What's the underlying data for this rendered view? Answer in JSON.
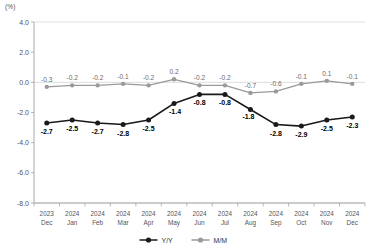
{
  "chart_data": {
    "type": "line",
    "title": "",
    "subtitle": "",
    "unit_label": "(%)",
    "xlabel": "",
    "ylabel": "",
    "ylim": [
      -8.0,
      4.0
    ],
    "yticks": [
      "4.0",
      "2.0",
      "0.0",
      "-2.0",
      "-4.0",
      "-6.0",
      "-8.0"
    ],
    "ytick_values": [
      4.0,
      2.0,
      0.0,
      -2.0,
      -4.0,
      -6.0,
      -8.0
    ],
    "grid": "horizontal-top-and-zero",
    "legend_position": "bottom-center",
    "categories": [
      "2023\nDec",
      "2024\nJan",
      "2024\nFeb",
      "2024\nMar",
      "2024\nApr",
      "2024\nMay",
      "2024\nJun",
      "2024\nJul",
      "2024\nAug",
      "2024\nSep",
      "2024\nOct",
      "2024\nNov",
      "2024\nDec"
    ],
    "category_years": [
      "2023",
      "2024",
      "2024",
      "2024",
      "2024",
      "2024",
      "2024",
      "2024",
      "2024",
      "2024",
      "2024",
      "2024",
      "2024"
    ],
    "category_months": [
      "Dec",
      "Jan",
      "Feb",
      "Mar",
      "Apr",
      "May",
      "Jun",
      "Jul",
      "Aug",
      "Sep",
      "Oct",
      "Nov",
      "Dec"
    ],
    "series": [
      {
        "name": "Y/Y",
        "color": "#1a1a1a",
        "values": [
          -2.7,
          -2.5,
          -2.7,
          -2.8,
          -2.5,
          -1.4,
          -0.8,
          -0.8,
          -1.8,
          -2.8,
          -2.9,
          -2.5,
          -2.3
        ],
        "labels": [
          "-2.7",
          "-2.5",
          "-2.7",
          "-2.8",
          "-2.5",
          "-1.4",
          "-0.8",
          "-0.8",
          "-1.8",
          "-2.8",
          "-2.9",
          "-2.5",
          "-2.3"
        ]
      },
      {
        "name": "M/M",
        "color": "#9a9a9a",
        "values": [
          -0.3,
          -0.2,
          -0.2,
          -0.1,
          -0.2,
          0.2,
          -0.2,
          -0.2,
          -0.7,
          -0.6,
          -0.1,
          0.1,
          -0.1
        ],
        "labels": [
          "-0.3",
          "-0.2",
          "-0.2",
          "-0.1",
          "-0.2",
          "0.2",
          "-0.2",
          "-0.2",
          "-0.7",
          "-0.6",
          "-0.1",
          "0.1",
          "-0.1"
        ]
      }
    ]
  },
  "legend": {
    "items": [
      {
        "label": "Y/Y",
        "color": "#1a1a1a"
      },
      {
        "label": "M/M",
        "color": "#9a9a9a"
      }
    ]
  },
  "colors": {
    "yy": "#1a1a1a",
    "mm": "#9a9a9a",
    "axis": "#9e9e9e",
    "grid": "#d8d8d8",
    "text": "#555555",
    "background": "#ffffff"
  }
}
